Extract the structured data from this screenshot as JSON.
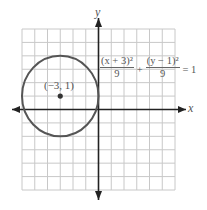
{
  "chart_data": {
    "type": "line",
    "title": "",
    "xlabel": "x",
    "ylabel": "y",
    "xlim": [
      -6,
      6
    ],
    "ylim": [
      -6,
      6
    ],
    "grid": true,
    "grid_step": 1,
    "series": [
      {
        "name": "circle",
        "shape": "circle",
        "center": [
          -3,
          1
        ],
        "radius": 3
      }
    ],
    "points": [
      {
        "x": -3,
        "y": 1,
        "label": "(−3, 1)"
      }
    ],
    "annotations": [
      {
        "type": "equation",
        "text": "(x + 3)^2/9 + (y − 1)^2/9 = 1"
      }
    ]
  },
  "labels": {
    "x_axis": "x",
    "y_axis": "y",
    "center_point": "(−3, 1)"
  },
  "equation": {
    "term1_num": "(x + 3)²",
    "term1_den": "9",
    "plus": "+",
    "term2_num": "(y − 1)²",
    "term2_den": "9",
    "rhs": "= 1"
  },
  "colors": {
    "grid": "#c8c8c8",
    "axes": "#222222",
    "circle": "#555555",
    "text": "#555555"
  }
}
